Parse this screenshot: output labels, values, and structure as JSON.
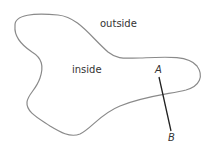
{
  "diagram": {
    "region_labels": {
      "outside": "outside",
      "inside": "inside"
    },
    "point_labels": {
      "a": "A",
      "b": "B"
    },
    "colors": {
      "curve": "#8a8a8a",
      "segment": "#222222",
      "text": "#333333"
    }
  }
}
